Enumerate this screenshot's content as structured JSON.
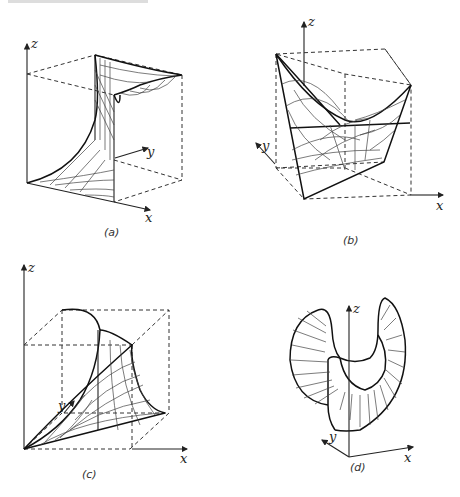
{
  "figure": {
    "panels": [
      {
        "id": "a",
        "caption": "(a)",
        "axes": {
          "x": "x",
          "y": "y",
          "z": "z"
        },
        "surface": "hyperbolic paraboloid, saddle, viewed along edge"
      },
      {
        "id": "b",
        "caption": "(b)",
        "axes": {
          "x": "x",
          "y": "y",
          "z": "z"
        },
        "surface": "saddle surface in cube"
      },
      {
        "id": "c",
        "caption": "(c)",
        "axes": {
          "x": "x",
          "y": "y",
          "z": "z"
        },
        "surface": "twisted surface in cube"
      },
      {
        "id": "d",
        "caption": "(d)",
        "axes": {
          "x": "x",
          "y": "y",
          "z": "z"
        },
        "surface": "ruled annular surface"
      }
    ]
  }
}
